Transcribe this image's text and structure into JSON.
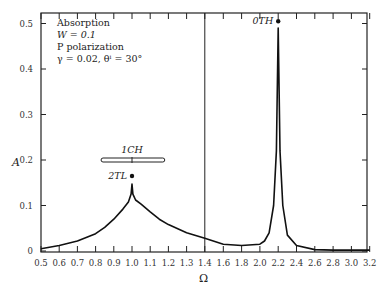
{
  "chart_data": {
    "type": "line",
    "title": "",
    "xlabel": "Ω",
    "ylabel": "A",
    "xlim": [
      0.5,
      3.2
    ],
    "ylim": [
      0,
      0.5
    ],
    "grid": false,
    "x_axis_note": "Axis scale changes at Ω = 1.4: 0.1 per division below, 0.2 per division above",
    "x_ticks": [
      "0.5",
      "0.6",
      "0.7",
      "0.8",
      "0.9",
      "1.0",
      "1.1",
      "1.2",
      "1.3",
      "1.4",
      "1.6",
      "1.8",
      "2.0",
      "2.2",
      "2.4",
      "2.6",
      "2.8",
      "3.0",
      "3.2"
    ],
    "y_ticks": [
      "0",
      "0.1",
      "0.2",
      "0.3",
      "0.4",
      "0.5"
    ],
    "legend_text": [
      "Absorption",
      "W = 0.1",
      "P polarization",
      "γ = 0.02, θⁱ = 30°"
    ],
    "vertical_line_at": 1.4,
    "series": [
      {
        "name": "Absorption A(Ω)",
        "x": [
          0.5,
          0.6,
          0.7,
          0.8,
          0.85,
          0.9,
          0.95,
          0.98,
          0.995,
          1.0,
          1.005,
          1.02,
          1.05,
          1.1,
          1.15,
          1.2,
          1.3,
          1.4,
          1.6,
          1.8,
          2.0,
          2.05,
          2.1,
          2.15,
          2.18,
          2.2,
          2.22,
          2.25,
          2.3,
          2.4,
          2.6,
          2.8,
          3.0,
          3.2
        ],
        "values": [
          0.005,
          0.012,
          0.022,
          0.038,
          0.052,
          0.07,
          0.092,
          0.108,
          0.125,
          0.147,
          0.125,
          0.112,
          0.103,
          0.086,
          0.07,
          0.058,
          0.04,
          0.028,
          0.015,
          0.012,
          0.015,
          0.022,
          0.04,
          0.1,
          0.22,
          0.49,
          0.22,
          0.1,
          0.035,
          0.012,
          0.003,
          0.002,
          0.002,
          0.002
        ]
      }
    ],
    "annotations": [
      {
        "label": "2TL",
        "x": 1.0,
        "y": 0.165,
        "marker": "dot"
      },
      {
        "label": "1CH",
        "x": 1.0,
        "y": 0.2,
        "marker": "range-bar",
        "range": [
          0.83,
          1.18
        ]
      },
      {
        "label": "0TH",
        "x": 2.2,
        "y": 0.505,
        "marker": "dot"
      }
    ]
  }
}
